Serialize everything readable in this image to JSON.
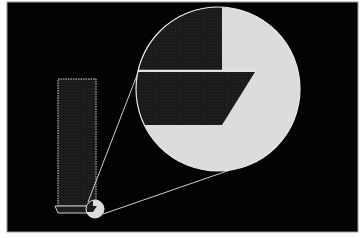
{
  "figure": {
    "title": "",
    "colors": {
      "background": "#ffffff",
      "panel": "#030303",
      "outline": "#d8d8d8",
      "dark_fill": "#1c1c1c",
      "light_fill": "#dcdcdc"
    },
    "elements": {
      "panel": {
        "x": 7,
        "y": 2,
        "width": 351,
        "height": 230
      },
      "tall_rectangle": {
        "x": 58,
        "y": 79,
        "width": 38,
        "height": 127
      },
      "base_bar": {
        "x": 55,
        "y": 206,
        "width": 45,
        "height": 7
      },
      "small_circle": {
        "cx": 95,
        "cy": 209,
        "r": 9
      },
      "large_circle": {
        "cx": 218,
        "cy": 89,
        "r": 82
      },
      "connector_lines": [
        {
          "x1": 88,
          "y1": 202,
          "x2": 139,
          "y2": 70
        },
        {
          "x1": 103,
          "y1": 214,
          "x2": 233,
          "y2": 169
        }
      ]
    }
  }
}
